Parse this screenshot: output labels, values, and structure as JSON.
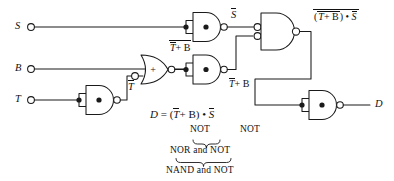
{
  "diagram": {
    "stroke_color": "#1a1a1a",
    "background": "#ffffff",
    "inputs": [
      {
        "name": "input-s",
        "label": "S",
        "x": 18,
        "y": 27
      },
      {
        "name": "input-b",
        "label": "B",
        "x": 18,
        "y": 69
      },
      {
        "name": "input-t",
        "label": "T",
        "x": 18,
        "y": 100
      }
    ],
    "gates": [
      {
        "name": "nand-s-inverter",
        "type": "NAND",
        "glyph": "•",
        "tied_inputs": true,
        "output_label": "S"
      },
      {
        "name": "nand-t-inverter",
        "type": "NAND",
        "glyph": "•",
        "tied_inputs": true,
        "output_label": "T"
      },
      {
        "name": "nor-gate",
        "type": "NOR",
        "glyph": "+",
        "bubbled_input": true,
        "output_label": "T + B"
      },
      {
        "name": "nand-tb-inverter",
        "type": "NAND",
        "glyph": "•",
        "tied_inputs": true,
        "output_label": "T + B"
      },
      {
        "name": "nand-combiner",
        "type": "NAND",
        "glyph": "•",
        "bubbled_inputs": true,
        "output_label": "(T + B) • S"
      },
      {
        "name": "nand-output-inverter",
        "type": "NAND",
        "glyph": "•",
        "tied_inputs": true,
        "output_label": "D"
      }
    ],
    "wire_labels": {
      "s_bar": "S",
      "t_bar": "T",
      "nor_out": "T + B",
      "tb_plain_left": "T",
      "tb_plain_right": "+ B",
      "combiner_out_inner": "T + B",
      "combiner_out_rest": ") • ",
      "combiner_out_s": "S",
      "combiner_out_open": "(",
      "output_d": "D"
    },
    "equation": {
      "lhs": "D",
      "eq": "=",
      "open": "(",
      "t_bar": "T",
      "plus_b": "+ B",
      "close": ")",
      "dot": "•",
      "s_bar": "S"
    },
    "annotations": {
      "not_left": "NOT",
      "not_right": "NOT",
      "nor_and_not": "NOR and NOT",
      "nand_and_not": "NAND and NOT"
    }
  }
}
